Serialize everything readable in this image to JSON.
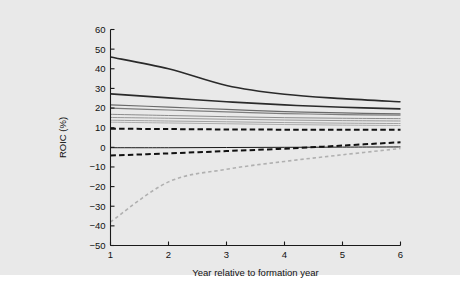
{
  "figure": {
    "background_color": "#e9e9e9",
    "plot_background_color": "#e9e9e9",
    "axis_color": "#1a1a1a"
  },
  "chart_data": {
    "type": "line",
    "title": "",
    "subtitle": "",
    "xlabel": "Year relative to formation year",
    "ylabel": "ROIC (%)",
    "xlim": [
      1,
      6
    ],
    "ylim": [
      -50,
      60
    ],
    "xticks": [
      1,
      2,
      3,
      4,
      5,
      6
    ],
    "xtick_labels": [
      "1",
      "2",
      "3",
      "4",
      "5",
      "6"
    ],
    "yticks": [
      -50,
      -40,
      -30,
      -20,
      -10,
      0,
      10,
      20,
      30,
      40,
      50,
      60
    ],
    "ytick_labels": [
      "−50",
      "−40",
      "−30",
      "−20",
      "−10",
      "0",
      "10",
      "20",
      "30",
      "40",
      "50",
      "60"
    ],
    "grid": false,
    "legend": "none",
    "x": [
      1,
      2,
      3,
      4,
      5,
      6
    ],
    "series": [
      {
        "name": "top-decile",
        "values": [
          46.0,
          40.0,
          31.5,
          27.0,
          24.8,
          23.2
        ],
        "color": "#2a2a2a",
        "style": "solid",
        "width": 1.6
      },
      {
        "name": "second-decile",
        "values": [
          27.2,
          25.2,
          23.2,
          21.6,
          20.4,
          19.6
        ],
        "color": "#2a2a2a",
        "style": "solid",
        "width": 1.6
      },
      {
        "name": "third-decile",
        "values": [
          21.6,
          20.5,
          19.3,
          18.2,
          17.5,
          17.0
        ],
        "color": "#6a6a6a",
        "style": "solid",
        "width": 1.2
      },
      {
        "name": "fourth-decile",
        "values": [
          20.0,
          19.0,
          18.0,
          17.2,
          16.7,
          16.4
        ],
        "color": "#7d7d7d",
        "style": "solid",
        "width": 1.2
      },
      {
        "name": "fifth-decile",
        "values": [
          16.8,
          16.2,
          15.6,
          15.1,
          14.8,
          14.6
        ],
        "color": "#8c8c8c",
        "style": "solid",
        "width": 1.0
      },
      {
        "name": "sixth-decile",
        "values": [
          15.2,
          14.8,
          14.3,
          13.9,
          13.6,
          13.4
        ],
        "color": "#989898",
        "style": "solid",
        "width": 1.0
      },
      {
        "name": "seventh-decile",
        "values": [
          13.8,
          13.4,
          13.0,
          12.6,
          12.3,
          12.1
        ],
        "color": "#a2a2a2",
        "style": "solid",
        "width": 1.0
      },
      {
        "name": "eighth-decile",
        "values": [
          12.8,
          12.4,
          12.0,
          11.6,
          11.3,
          11.1
        ],
        "color": "#adadad",
        "style": "solid",
        "width": 1.0
      },
      {
        "name": "median-dashed",
        "values": [
          9.5,
          9.3,
          9.1,
          9.0,
          9.0,
          9.0
        ],
        "color": "#111111",
        "style": "dashed-medium",
        "width": 2.0
      },
      {
        "name": "zero-reference",
        "values": [
          -0.2,
          -0.2,
          -0.1,
          0.0,
          0.1,
          0.2
        ],
        "color": "#1a1a1a",
        "style": "solid",
        "width": 1.0
      },
      {
        "name": "ninth-decile-dashed",
        "values": [
          -4.2,
          -3.1,
          -1.9,
          -0.7,
          0.9,
          2.6
        ],
        "color": "#111111",
        "style": "dashed-medium",
        "width": 2.0
      },
      {
        "name": "bottom-decile-dashed",
        "values": [
          -38.0,
          -17.6,
          -11.2,
          -7.2,
          -3.8,
          -0.6
        ],
        "color": "#b0b0b0",
        "style": "dashed-fine",
        "width": 1.6
      }
    ]
  }
}
